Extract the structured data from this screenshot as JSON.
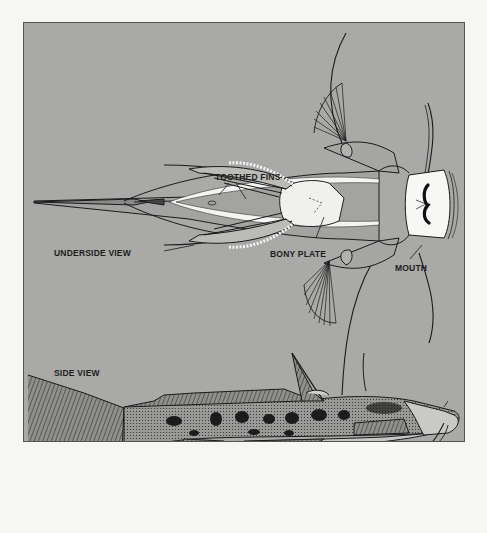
{
  "figure": {
    "background_color": "#a9a9a7",
    "page_color": "#f6f6f3",
    "views": [
      {
        "id": "underside",
        "label": "UNDERSIDE VIEW"
      },
      {
        "id": "side",
        "label": "SIDE VIEW"
      }
    ],
    "labels": {
      "toothed_fins": "TOOTHED FINS",
      "underside_view": "UNDERSIDE VIEW",
      "bony_plate": "BONY PLATE",
      "mouth": "MOUTH",
      "side_view": "SIDE VIEW"
    }
  }
}
